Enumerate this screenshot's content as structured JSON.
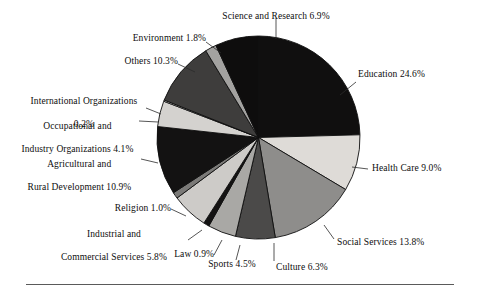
{
  "figure": {
    "background_color": "#ffffff",
    "rule_color": "#5a5a5a"
  },
  "chart_data": {
    "type": "pie",
    "title": "",
    "subtitle": "",
    "xlabel": "",
    "ylabel": "",
    "legend_position": "none",
    "grid": false,
    "start_angle_deg": 0,
    "direction": "clockwise",
    "units": "percent",
    "total": 100.1,
    "categories": [
      "Education",
      "Health Care",
      "Social Services",
      "Culture",
      "Sports",
      "Law",
      "Industrial and Commercial Services",
      "Religion",
      "Agricultural and Rural Development",
      "Occupational and Industry Organizations",
      "International Organizations",
      "Others",
      "Environment",
      "Science and Research"
    ],
    "values": [
      24.6,
      9.0,
      13.8,
      6.3,
      4.5,
      0.9,
      5.8,
      1.0,
      10.9,
      4.1,
      0.2,
      10.3,
      1.8,
      6.9
    ],
    "slice_colors": [
      "#100f0f",
      "#dedbd7",
      "#8e8d8b",
      "#4b4a49",
      "#a9a8a5",
      "#141313",
      "#cdcbc8",
      "#7b7a78",
      "#131212",
      "#d4d2cf",
      "#fbfbfa",
      "#3e3d3c",
      "#a3a2a0",
      "#0e0d0d"
    ],
    "labels": [
      {
        "name": "Education",
        "text": "Education 24.6%",
        "percent": 24.6
      },
      {
        "name": "Health Care",
        "text": "Health Care 9.0%",
        "percent": 9.0
      },
      {
        "name": "Social Services",
        "text": "Social Services 13.8%",
        "percent": 13.8
      },
      {
        "name": "Culture",
        "text": "Culture 6.3%",
        "percent": 6.3
      },
      {
        "name": "Sports",
        "text": "Sports 4.5%",
        "percent": 4.5
      },
      {
        "name": "Law",
        "text": "Law 0.9%",
        "percent": 0.9
      },
      {
        "name": "Industrial and Commercial Services",
        "text": "Industrial and\nCommercial Services 5.8%",
        "percent": 5.8
      },
      {
        "name": "Religion",
        "text": "Religion 1.0%",
        "percent": 1.0
      },
      {
        "name": "Agricultural and Rural Development",
        "text": "Agricultural and\nRural Development 10.9%",
        "percent": 10.9
      },
      {
        "name": "Occupational and Industry Organizations",
        "text": "Occupational and\nIndustry Organizations 4.1%",
        "percent": 4.1
      },
      {
        "name": "International Organizations",
        "text": "International Organizations\n0.2%",
        "percent": 0.2
      },
      {
        "name": "Others",
        "text": "Others 10.3%",
        "percent": 10.3
      },
      {
        "name": "Environment",
        "text": "Environment 1.8%",
        "percent": 1.8
      },
      {
        "name": "Science and Research",
        "text": "Science and Research 6.9%",
        "percent": 6.9
      }
    ]
  },
  "labels": {
    "science_and_research": "Science and Research 6.9%",
    "environment": "Environment 1.8%",
    "others": "Others 10.3%",
    "international_organizations_l1": "International Organizations",
    "international_organizations_l2": "0.2%",
    "occupational_l1": "Occupational and",
    "occupational_l2": "Industry Organizations 4.1%",
    "agricultural_l1": "Agricultural and",
    "agricultural_l2": "Rural Development 10.9%",
    "religion": "Religion 1.0%",
    "industrial_l1": "Industrial and",
    "industrial_l2": "Commercial Services 5.8%",
    "law": "Law 0.9%",
    "sports": "Sports 4.5%",
    "culture": "Culture 6.3%",
    "social_services": "Social Services 13.8%",
    "health_care": "Health Care 9.0%",
    "education": "Education 24.6%"
  }
}
